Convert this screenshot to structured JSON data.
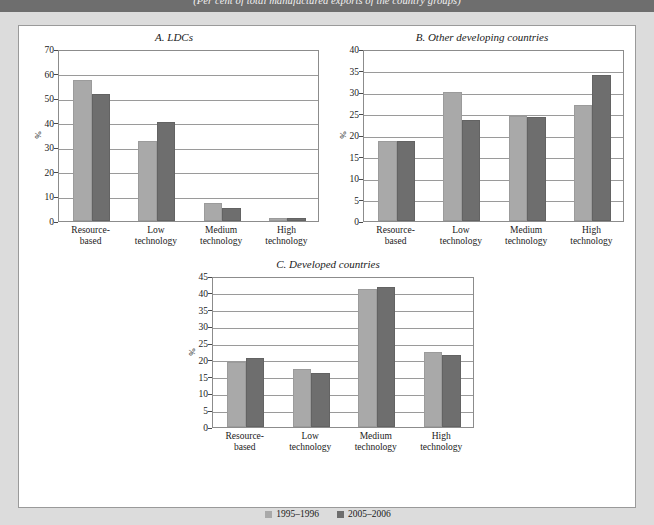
{
  "header": {
    "subtitle": "(Per cent of total manufactured exports of the country groups)"
  },
  "legend": {
    "series": [
      {
        "label": "1995–1996",
        "color": "#a9a9a9"
      },
      {
        "label": "2005–2006",
        "color": "#6e6e6e"
      }
    ]
  },
  "colors": {
    "band": "#6e6e6e",
    "page_background": "#dcdcdc",
    "panel_background": "#ffffff",
    "series_1995_1996": "#a9a9a9",
    "series_2005_2006": "#6e6e6e",
    "grid": "#9a9a9a"
  },
  "chart_data": [
    {
      "id": "A",
      "type": "bar",
      "title": "A. LDCs",
      "xlabel": "",
      "ylabel": "%",
      "ylim": [
        0,
        70
      ],
      "yticks": [
        0,
        10,
        20,
        30,
        40,
        50,
        60,
        70
      ],
      "grid": true,
      "legend_position": "bottom-shared",
      "categories": [
        "Resource-based",
        "Low technology",
        "Medium technology",
        "High technology"
      ],
      "series": [
        {
          "name": "1995–1996",
          "values": [
            57.5,
            32.5,
            7.5,
            1.3
          ]
        },
        {
          "name": "2005–2006",
          "values": [
            51.5,
            40.5,
            5.5,
            1.2
          ]
        }
      ]
    },
    {
      "id": "B",
      "type": "bar",
      "title": "B. Other developing countries",
      "xlabel": "",
      "ylabel": "%",
      "ylim": [
        0,
        40
      ],
      "yticks": [
        0,
        5,
        10,
        15,
        20,
        25,
        30,
        35,
        40
      ],
      "grid": true,
      "legend_position": "bottom-shared",
      "categories": [
        "Resource-based",
        "Low technology",
        "Medium technology",
        "High technology"
      ],
      "series": [
        {
          "name": "1995–1996",
          "values": [
            18.7,
            30.0,
            24.4,
            27.0
          ]
        },
        {
          "name": "2005–2006",
          "values": [
            18.5,
            23.4,
            24.2,
            34.0
          ]
        }
      ]
    },
    {
      "id": "C",
      "type": "bar",
      "title": "C. Developed countries",
      "xlabel": "",
      "ylabel": "%",
      "ylim": [
        0,
        45
      ],
      "yticks": [
        0,
        5,
        10,
        15,
        20,
        25,
        30,
        35,
        40,
        45
      ],
      "grid": true,
      "legend_position": "bottom-shared",
      "categories": [
        "Resource-based",
        "Low technology",
        "Medium technology",
        "High technology"
      ],
      "series": [
        {
          "name": "1995–1996",
          "values": [
            19.5,
            17.3,
            41.0,
            22.4
          ]
        },
        {
          "name": "2005–2006",
          "values": [
            20.5,
            16.2,
            41.8,
            21.6
          ]
        }
      ]
    }
  ],
  "category_label_lines": {
    "Resource-based": [
      "Resource-",
      "based"
    ],
    "Low technology": [
      "Low",
      "technology"
    ],
    "Medium technology": [
      "Medium",
      "technology"
    ],
    "High technology": [
      "High",
      "technology"
    ]
  }
}
